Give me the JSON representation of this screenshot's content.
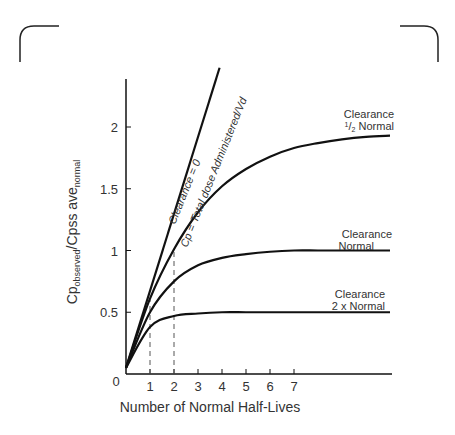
{
  "chart_data": {
    "type": "line",
    "title": "",
    "xlabel": "Number of Normal Half-Lives",
    "ylabel": "Cp_observed / Cpss ave_normal",
    "ylabel_parts": {
      "main1": "Cp",
      "sub1": "observed",
      "main2": "/Cpss ave",
      "sub2": "normal"
    },
    "xlim": [
      0,
      11
    ],
    "ylim": [
      0,
      2.5
    ],
    "x_ticks": [
      1,
      2,
      3,
      4,
      5,
      6,
      7
    ],
    "x_tick_labels": [
      "1",
      "2",
      "3",
      "4",
      "5",
      "6",
      "7"
    ],
    "y_ticks": [
      0,
      0.5,
      1,
      1.5,
      2
    ],
    "y_tick_labels": [
      "0",
      "0.5",
      "1",
      "1.5",
      "2"
    ],
    "origin_label": "0",
    "grid": false,
    "legend": "none (inline curve labels)",
    "series": [
      {
        "name": "Clearance = 0",
        "annotation": "Cp = Total dose Administered/Vd",
        "shape": "straight line",
        "x": [
          0,
          1,
          2,
          3,
          3.9
        ],
        "values": [
          0.05,
          0.64,
          1.28,
          1.92,
          2.48
        ]
      },
      {
        "name": "Clearance 1/2 Normal",
        "x": [
          0,
          1,
          2,
          3,
          4,
          5,
          6,
          7,
          8,
          9,
          10,
          11
        ],
        "values": [
          0.05,
          0.61,
          1.01,
          1.31,
          1.52,
          1.66,
          1.76,
          1.83,
          1.87,
          1.9,
          1.92,
          1.93
        ]
      },
      {
        "name": "Clearance Normal",
        "x": [
          0,
          1,
          2,
          3,
          4,
          5,
          6,
          7,
          8,
          9,
          10,
          11
        ],
        "values": [
          0.05,
          0.5,
          0.75,
          0.88,
          0.94,
          0.97,
          0.99,
          1.0,
          1.0,
          1.0,
          1.0,
          1.0
        ]
      },
      {
        "name": "Clearance 2 x Normal",
        "x": [
          0,
          1,
          2,
          3,
          4,
          5,
          6,
          7,
          8,
          9,
          10,
          11
        ],
        "values": [
          0.05,
          0.38,
          0.47,
          0.49,
          0.5,
          0.5,
          0.5,
          0.5,
          0.5,
          0.5,
          0.5,
          0.5
        ]
      }
    ],
    "reference_lines": [
      {
        "type": "dashed-vertical",
        "x": 1,
        "y_top": 0.6
      },
      {
        "type": "dashed-vertical",
        "x": 2,
        "y_top": 1.0
      }
    ]
  },
  "labels": {
    "clearance_zero": "Clearance = 0",
    "cp_total": "Cp = Total dose Administered/Vd",
    "half_line1": "Clearance",
    "half_num": "1",
    "half_den": "2",
    "half_line2": " Normal",
    "normal_line1": "Clearance",
    "normal_line2": "Normal",
    "double_line1": "Clearance",
    "double_line2": "2 x Normal"
  },
  "colors": {
    "line": "#111111",
    "text": "#333333",
    "dashed": "#555555",
    "frame": "#222222"
  }
}
